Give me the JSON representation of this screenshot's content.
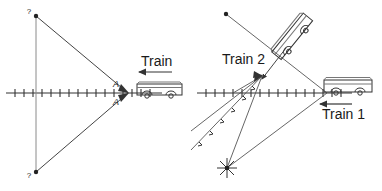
{
  "figure": {
    "type": "physics-diagram",
    "background": "#ffffff",
    "stroke_color": "#333333",
    "text_color": "#1a1a1a"
  },
  "left_panel": {
    "name": "single-train-diagram",
    "axis": {
      "y": 93,
      "x_start": 6,
      "x_end": 162,
      "tick_count": 17,
      "tick_spacing": 9,
      "tick_half_height": 4
    },
    "vertex": {
      "x": 128,
      "y": 93
    },
    "vertical_line": {
      "x": 36,
      "y_top": 16,
      "y_bottom": 172
    },
    "rays": [
      {
        "name": "upper-ray",
        "x1": 36,
        "y1": 16,
        "x2": 128,
        "y2": 93
      },
      {
        "name": "lower-ray",
        "x1": 36,
        "y1": 172,
        "x2": 128,
        "y2": 93
      }
    ],
    "endpoint_dots": [
      {
        "x": 36,
        "y": 16
      },
      {
        "x": 36,
        "y": 172
      }
    ],
    "question_marks": [
      {
        "text": "?",
        "x": 29,
        "y": 14
      },
      {
        "text": "?",
        "x": 29,
        "y": 176
      }
    ],
    "angle_labels": [
      {
        "text": "A",
        "x": 116,
        "y": 86
      },
      {
        "text": "A",
        "x": 116,
        "y": 104
      }
    ],
    "train": {
      "label": "Train",
      "label_x": 141,
      "label_y": 65,
      "arrow": {
        "x1": 172,
        "y1": 73,
        "x2": 140,
        "y2": 73,
        "direction": "left"
      },
      "body": {
        "x": 137,
        "y": 84,
        "width": 45,
        "height": 11
      },
      "wheels": [
        {
          "cx": 147,
          "cy": 97,
          "r": 3
        },
        {
          "cx": 171,
          "cy": 97,
          "r": 3
        }
      ]
    }
  },
  "right_panel": {
    "name": "two-train-diagram",
    "axis": {
      "y": 93,
      "x_start": 197,
      "x_end": 352,
      "tick_count": 17,
      "tick_spacing": 9,
      "tick_half_height": 4
    },
    "convergence_point": {
      "x": 262,
      "y": 76
    },
    "flash_point": {
      "x": 227,
      "y": 168
    },
    "train1": {
      "label": "Train 1",
      "label_x": 325,
      "label_y": 116,
      "arrow": {
        "x1": 352,
        "y1": 104,
        "x2": 320,
        "y2": 104,
        "direction": "left"
      },
      "body": {
        "x": 324,
        "y": 80,
        "width": 48,
        "height": 12
      },
      "wheels": [
        {
          "cx": 336,
          "cy": 94,
          "r": 3
        },
        {
          "cx": 360,
          "cy": 94,
          "r": 3
        }
      ]
    },
    "train2": {
      "label": "Train 2",
      "label_x": 222,
      "label_y": 63,
      "rotation_deg": -51,
      "pivot": {
        "x": 293,
        "y": 37
      },
      "body": {
        "x": 268,
        "y": 30,
        "width": 50,
        "height": 13
      },
      "wheels": [
        {
          "cx": 280,
          "cy": 46,
          "r": 3
        },
        {
          "cx": 305,
          "cy": 46,
          "r": 3
        }
      ]
    },
    "rays": [
      {
        "name": "ray-from-upper-left-dot",
        "x1": 226,
        "y1": 14,
        "x2": 327,
        "y2": 93
      },
      {
        "name": "ray-flash-to-train1",
        "x1": 227,
        "y1": 168,
        "x2": 327,
        "y2": 93
      },
      {
        "name": "ray-flash-to-convergence",
        "x1": 227,
        "y1": 168,
        "x2": 262,
        "y2": 76
      },
      {
        "name": "ray-lower-left-a",
        "x1": 191,
        "y1": 148,
        "x2": 262,
        "y2": 76
      },
      {
        "name": "ray-lower-left-b",
        "x1": 191,
        "y1": 130,
        "x2": 262,
        "y2": 76
      },
      {
        "name": "ray-axis-left-to-convergence",
        "x1": 236,
        "y1": 93,
        "x2": 262,
        "y2": 76
      },
      {
        "name": "ray-train2-down",
        "x1": 284,
        "y1": 46,
        "x2": 258,
        "y2": 82
      }
    ],
    "endpoint_dots": [
      {
        "x": 226,
        "y": 14
      }
    ]
  }
}
